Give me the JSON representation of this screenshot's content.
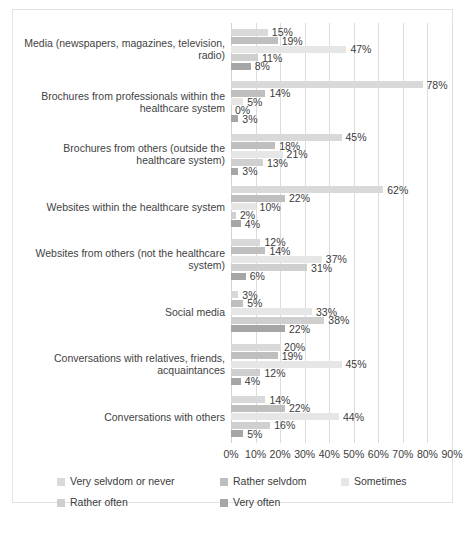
{
  "chart_data": {
    "type": "bar",
    "orientation": "horizontal",
    "title": "",
    "xlabel": "",
    "ylabel": "",
    "xlim": [
      0,
      90
    ],
    "grid": true,
    "legend_position": "bottom",
    "xticks": [
      "0%",
      "10%",
      "20%",
      "30%",
      "40%",
      "50%",
      "60%",
      "70%",
      "80%",
      "90%"
    ],
    "xtick_values": [
      0,
      10,
      20,
      30,
      40,
      50,
      60,
      70,
      80,
      90
    ],
    "categories": [
      "Media (newspapers, magazines, television, radio)",
      "Brochures from professionals within the healthcare system",
      "Brochures from others (outside the healthcare system)",
      "Websites within the healthcare system",
      "Websites from others (not the healthcare system)",
      "Social media",
      "Conversations with relatives, friends, acquaintances",
      "Conversations with others"
    ],
    "series": [
      {
        "name": "Very selvdom or never",
        "color": "#d9d9d9",
        "values": [
          15,
          78,
          45,
          62,
          12,
          3,
          20,
          14
        ],
        "labels": [
          "15%",
          "78%",
          "45%",
          "62%",
          "12%",
          "3%",
          "20%",
          "14%"
        ]
      },
      {
        "name": "Rather selvdom",
        "color": "#bfbfbf",
        "values": [
          19,
          14,
          18,
          22,
          14,
          5,
          19,
          22
        ],
        "labels": [
          "19%",
          "14%",
          "18%",
          "22%",
          "14%",
          "5%",
          "19%",
          "22%"
        ]
      },
      {
        "name": "Sometimes",
        "color": "#e6e6e6",
        "values": [
          47,
          5,
          21,
          10,
          37,
          33,
          45,
          44
        ],
        "labels": [
          "47%",
          "5%",
          "21%",
          "10%",
          "37%",
          "33%",
          "45%",
          "44%"
        ]
      },
      {
        "name": "Rather often",
        "color": "#cfcfcf",
        "values": [
          11,
          0,
          13,
          2,
          31,
          38,
          12,
          16
        ],
        "labels": [
          "11%",
          "0%",
          "13%",
          "2%",
          "31%",
          "38%",
          "12%",
          "16%"
        ]
      },
      {
        "name": "Very often",
        "color": "#a6a6a6",
        "values": [
          8,
          3,
          3,
          4,
          6,
          22,
          4,
          5
        ],
        "labels": [
          "8%",
          "3%",
          "3%",
          "4%",
          "6%",
          "22%",
          "4%",
          "5%"
        ]
      }
    ]
  },
  "caption": {
    "text": ""
  }
}
